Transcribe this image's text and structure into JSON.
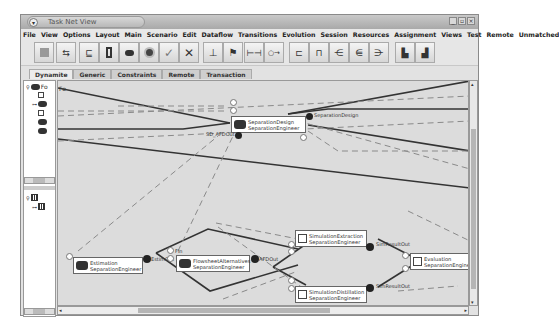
{
  "window": {
    "title": "Task Net View",
    "controls": [
      "minimize",
      "maximize",
      "close"
    ]
  },
  "menubar": {
    "items": [
      "File",
      "View",
      "Options",
      "Layout",
      "Main",
      "Scenario",
      "Edit",
      "Dataflow",
      "Transitions",
      "Evolution",
      "Session",
      "Resources",
      "Assignment",
      "Views",
      "Test",
      "Remote",
      "Unmatched"
    ]
  },
  "toolbar": {
    "buttons": [
      {
        "name": "stop",
        "icon": "square-icon"
      },
      {
        "name": "workflow",
        "icon": "workflow-icon"
      },
      {
        "name": "task",
        "icon": "task-icon"
      },
      {
        "name": "document",
        "icon": "document-icon"
      },
      {
        "name": "agents",
        "icon": "gears-icon"
      },
      {
        "name": "record",
        "icon": "record-icon"
      },
      {
        "name": "accept",
        "icon": "check-icon"
      },
      {
        "name": "reject",
        "icon": "x-icon"
      },
      {
        "name": "connect-vertical",
        "icon": "connector-icon"
      },
      {
        "name": "attach",
        "icon": "attach-icon"
      },
      {
        "name": "link",
        "icon": "link-icon"
      },
      {
        "name": "dataflow",
        "icon": "dataflow-icon"
      },
      {
        "name": "split",
        "icon": "split-icon"
      },
      {
        "name": "join",
        "icon": "join-icon"
      },
      {
        "name": "merge",
        "icon": "merge-icon"
      },
      {
        "name": "branch",
        "icon": "branch-icon"
      },
      {
        "name": "fanout",
        "icon": "fanout-icon"
      },
      {
        "name": "export",
        "icon": "export-icon"
      },
      {
        "name": "import",
        "icon": "import-icon"
      }
    ]
  },
  "tabs": [
    {
      "label": "Dynamite",
      "active": true
    },
    {
      "label": "Generic",
      "active": false
    },
    {
      "label": "Constraints",
      "active": false
    },
    {
      "label": "Remote",
      "active": false
    },
    {
      "label": "Transaction",
      "active": false
    }
  ],
  "tree": {
    "root_label": "Fo",
    "items": [
      "",
      "",
      "",
      "",
      ""
    ]
  },
  "canvas": {
    "corner_label": "Fo",
    "nodes": [
      {
        "id": "separation-design",
        "line1": "SeparationDesign",
        "line2": "SeparationEngineer"
      },
      {
        "id": "estimation",
        "line1": "Estimation",
        "line2": "SeparationEngineer"
      },
      {
        "id": "flowsheet-alternatives",
        "line1": "FlowsheetAlternatives",
        "line2": "SeparationEngineer"
      },
      {
        "id": "simulation-extraction",
        "line1": "SimulationExtraction",
        "line2": "SeparationEngineer"
      },
      {
        "id": "simulation-distillation",
        "line1": "SimulationDistillation",
        "line2": "SeparationEngineer"
      },
      {
        "id": "evaluation",
        "line1": "Evaluation",
        "line2": "SeparationEngineer"
      }
    ],
    "port_labels": {
      "sd_afdout": "SD_AFDOut",
      "separation_design": "SeparationDesign",
      "estim_out": "EstimOut",
      "fin": "FIn",
      "afdout": "AFDOut",
      "sim_result_out_1": "SimResultOut",
      "sim_result_out_2": "SimResultOut"
    }
  },
  "colors": {
    "canvas_bg": "#dcdcdc",
    "edge_solid": "#333333",
    "edge_dashed": "#8a8a8a",
    "node_bg": "#ffffff"
  }
}
